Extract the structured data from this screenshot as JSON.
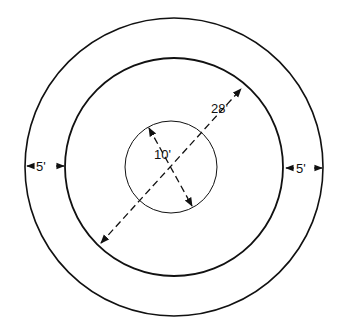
{
  "diagram": {
    "title": "",
    "circles": [
      {
        "name": "outer",
        "cx": 174,
        "cy": 167,
        "r": 149
      },
      {
        "name": "middle",
        "cx": 174,
        "cy": 167,
        "r": 109
      },
      {
        "name": "inner",
        "cx": 171,
        "cy": 167,
        "r": 46
      }
    ],
    "labels": {
      "inner_diameter": "10'",
      "middle_diameter": "28'",
      "left_gap": "5'",
      "right_gap": "5'"
    },
    "colors": {
      "line": "#111111",
      "background": "#ffffff"
    }
  }
}
